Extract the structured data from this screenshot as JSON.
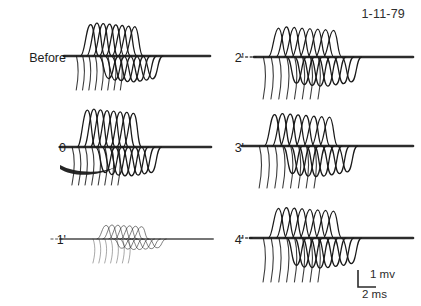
{
  "figure": {
    "date": "1-11-79",
    "background_color": "#ffffff",
    "ink_color": "#1a1a1a",
    "width": 421,
    "height": 306
  },
  "panels": [
    {
      "label": "Before",
      "column": "left",
      "row": 1,
      "faint": false,
      "artifact_blob": false,
      "sweeps": 8
    },
    {
      "label": "0",
      "column": "left",
      "row": 2,
      "faint": false,
      "artifact_blob": true,
      "sweeps": 8
    },
    {
      "label": "1'",
      "column": "left",
      "row": 3,
      "faint": true,
      "artifact_blob": false,
      "sweeps": 7
    },
    {
      "label": "2'",
      "column": "right",
      "row": 1,
      "faint": false,
      "artifact_blob": false,
      "sweeps": 8
    },
    {
      "label": "3'",
      "column": "right",
      "row": 2,
      "faint": false,
      "artifact_blob": false,
      "sweeps": 8
    },
    {
      "label": "4'",
      "column": "right",
      "row": 3,
      "faint": false,
      "artifact_blob": false,
      "sweeps": 8
    }
  ],
  "scalebar": {
    "vertical_label": "1 mv",
    "horizontal_label": "2 ms"
  },
  "chart_data": {
    "type": "line",
    "title": "",
    "subtitle": "",
    "xlabel": "Time (ms)",
    "ylabel": "Amplitude (mV)",
    "xlim": [
      0,
      20
    ],
    "ylim": [
      -1.4,
      1.4
    ],
    "grid": false,
    "legend_position": "none",
    "calibration": {
      "vertical": "1 mv",
      "horizontal": "2 ms"
    },
    "annotations": [
      "1-11-79"
    ],
    "panels": [
      {
        "name": "Before",
        "series": [
          {
            "name": "sweep-1",
            "latency_ms": 4.2,
            "peak_mv": 1.05,
            "trough_mv": -0.75
          },
          {
            "name": "sweep-2",
            "latency_ms": 5.0,
            "peak_mv": 1.1,
            "trough_mv": -0.8
          },
          {
            "name": "sweep-3",
            "latency_ms": 5.8,
            "peak_mv": 1.08,
            "trough_mv": -0.82
          },
          {
            "name": "sweep-4",
            "latency_ms": 6.6,
            "peak_mv": 1.06,
            "trough_mv": -0.85
          },
          {
            "name": "sweep-5",
            "latency_ms": 7.4,
            "peak_mv": 1.04,
            "trough_mv": -0.86
          },
          {
            "name": "sweep-6",
            "latency_ms": 8.2,
            "peak_mv": 1.02,
            "trough_mv": -0.84
          },
          {
            "name": "sweep-7",
            "latency_ms": 9.0,
            "peak_mv": 1.0,
            "trough_mv": -0.8
          },
          {
            "name": "sweep-8",
            "latency_ms": 9.8,
            "peak_mv": 0.98,
            "trough_mv": -0.76
          }
        ]
      },
      {
        "name": "0",
        "series": [
          {
            "name": "sweep-1",
            "latency_ms": 4.6,
            "peak_mv": 1.15,
            "trough_mv": -0.8
          },
          {
            "name": "sweep-2",
            "latency_ms": 5.4,
            "peak_mv": 1.18,
            "trough_mv": -0.86
          },
          {
            "name": "sweep-3",
            "latency_ms": 6.2,
            "peak_mv": 1.16,
            "trough_mv": -0.88
          },
          {
            "name": "sweep-4",
            "latency_ms": 7.0,
            "peak_mv": 1.14,
            "trough_mv": -0.9
          },
          {
            "name": "sweep-5",
            "latency_ms": 7.8,
            "peak_mv": 1.12,
            "trough_mv": -0.9
          },
          {
            "name": "sweep-6",
            "latency_ms": 8.6,
            "peak_mv": 1.1,
            "trough_mv": -0.88
          },
          {
            "name": "sweep-7",
            "latency_ms": 9.4,
            "peak_mv": 1.08,
            "trough_mv": -0.84
          },
          {
            "name": "sweep-8",
            "latency_ms": 10.2,
            "peak_mv": 1.05,
            "trough_mv": -0.8
          }
        ]
      },
      {
        "name": "1'",
        "series": [
          {
            "name": "sweep-1",
            "latency_ms": 6.0,
            "peak_mv": 0.62,
            "trough_mv": -0.42
          },
          {
            "name": "sweep-2",
            "latency_ms": 6.7,
            "peak_mv": 0.64,
            "trough_mv": -0.46
          },
          {
            "name": "sweep-3",
            "latency_ms": 7.4,
            "peak_mv": 0.63,
            "trough_mv": -0.48
          },
          {
            "name": "sweep-4",
            "latency_ms": 8.1,
            "peak_mv": 0.61,
            "trough_mv": -0.48
          },
          {
            "name": "sweep-5",
            "latency_ms": 8.8,
            "peak_mv": 0.6,
            "trough_mv": -0.46
          },
          {
            "name": "sweep-6",
            "latency_ms": 9.5,
            "peak_mv": 0.58,
            "trough_mv": -0.44
          },
          {
            "name": "sweep-7",
            "latency_ms": 10.2,
            "peak_mv": 0.56,
            "trough_mv": -0.4
          }
        ]
      },
      {
        "name": "2'",
        "series": [
          {
            "name": "sweep-1",
            "latency_ms": 5.0,
            "peak_mv": 1.0,
            "trough_mv": -0.9
          },
          {
            "name": "sweep-2",
            "latency_ms": 5.8,
            "peak_mv": 1.04,
            "trough_mv": -0.95
          },
          {
            "name": "sweep-3",
            "latency_ms": 6.6,
            "peak_mv": 1.02,
            "trough_mv": -0.98
          },
          {
            "name": "sweep-4",
            "latency_ms": 7.4,
            "peak_mv": 1.0,
            "trough_mv": -1.0
          },
          {
            "name": "sweep-5",
            "latency_ms": 8.2,
            "peak_mv": 0.98,
            "trough_mv": -1.0
          },
          {
            "name": "sweep-6",
            "latency_ms": 9.0,
            "peak_mv": 0.96,
            "trough_mv": -0.96
          },
          {
            "name": "sweep-7",
            "latency_ms": 9.8,
            "peak_mv": 0.94,
            "trough_mv": -0.92
          },
          {
            "name": "sweep-8",
            "latency_ms": 10.6,
            "peak_mv": 0.92,
            "trough_mv": -0.86
          }
        ]
      },
      {
        "name": "3'",
        "series": [
          {
            "name": "sweep-1",
            "latency_ms": 4.8,
            "peak_mv": 1.05,
            "trough_mv": -0.92
          },
          {
            "name": "sweep-2",
            "latency_ms": 5.6,
            "peak_mv": 1.08,
            "trough_mv": -0.98
          },
          {
            "name": "sweep-3",
            "latency_ms": 6.4,
            "peak_mv": 1.06,
            "trough_mv": -1.0
          },
          {
            "name": "sweep-4",
            "latency_ms": 7.2,
            "peak_mv": 1.04,
            "trough_mv": -1.02
          },
          {
            "name": "sweep-5",
            "latency_ms": 8.0,
            "peak_mv": 1.02,
            "trough_mv": -1.0
          },
          {
            "name": "sweep-6",
            "latency_ms": 8.8,
            "peak_mv": 1.0,
            "trough_mv": -0.96
          },
          {
            "name": "sweep-7",
            "latency_ms": 9.6,
            "peak_mv": 0.98,
            "trough_mv": -0.92
          },
          {
            "name": "sweep-8",
            "latency_ms": 10.4,
            "peak_mv": 0.96,
            "trough_mv": -0.86
          }
        ]
      },
      {
        "name": "4'",
        "series": [
          {
            "name": "sweep-1",
            "latency_ms": 5.2,
            "peak_mv": 1.02,
            "trough_mv": -0.94
          },
          {
            "name": "sweep-2",
            "latency_ms": 6.0,
            "peak_mv": 1.05,
            "trough_mv": -1.0
          },
          {
            "name": "sweep-3",
            "latency_ms": 6.8,
            "peak_mv": 1.03,
            "trough_mv": -1.02
          },
          {
            "name": "sweep-4",
            "latency_ms": 7.6,
            "peak_mv": 1.01,
            "trough_mv": -1.04
          },
          {
            "name": "sweep-5",
            "latency_ms": 8.4,
            "peak_mv": 0.99,
            "trough_mv": -1.02
          },
          {
            "name": "sweep-6",
            "latency_ms": 9.2,
            "peak_mv": 0.97,
            "trough_mv": -0.98
          },
          {
            "name": "sweep-7",
            "latency_ms": 10.0,
            "peak_mv": 0.95,
            "trough_mv": -0.94
          },
          {
            "name": "sweep-8",
            "latency_ms": 10.8,
            "peak_mv": 0.93,
            "trough_mv": -0.88
          }
        ]
      }
    ]
  }
}
